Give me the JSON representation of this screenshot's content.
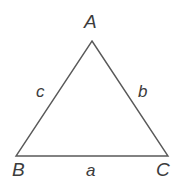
{
  "figure": {
    "kind": "triangle-diagram",
    "background_color": "#ffffff",
    "stroke_color": "#595959",
    "label_color": "#3c3c3c",
    "stroke_width": 1.4,
    "vertices": {
      "A": {
        "label": "A",
        "x": 92,
        "y": 41
      },
      "B": {
        "label": "B",
        "x": 16,
        "y": 156
      },
      "C": {
        "label": "C",
        "x": 168,
        "y": 156
      }
    },
    "sides": {
      "a": {
        "label": "a",
        "between": "B-C"
      },
      "b": {
        "label": "b",
        "between": "A-C"
      },
      "c": {
        "label": "c",
        "between": "A-B"
      }
    }
  }
}
